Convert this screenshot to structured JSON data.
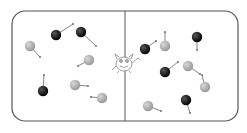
{
  "diagram": {
    "container": {
      "x": 12,
      "y": 11,
      "width": 226,
      "height": 110,
      "radius": 13,
      "stroke": "#555555"
    },
    "divider": {
      "x": 125,
      "y1": 11,
      "y2": 121,
      "stroke": "#555555"
    },
    "colors": {
      "fast": "#111111",
      "slow": "#a8a8a8",
      "arrow": "#666666"
    },
    "particles": [
      {
        "side": "left",
        "type": "fast",
        "x": 56,
        "y": 35,
        "ax": 73,
        "ay": 24
      },
      {
        "side": "left",
        "type": "fast",
        "x": 81,
        "y": 32,
        "ax": 96,
        "ay": 46
      },
      {
        "side": "left",
        "type": "slow",
        "x": 30,
        "y": 46,
        "ax": 40,
        "ay": 57
      },
      {
        "side": "left",
        "type": "slow",
        "x": 89,
        "y": 60,
        "ax": 78,
        "ay": 66
      },
      {
        "side": "left",
        "type": "fast",
        "x": 43,
        "y": 91,
        "ax": 44,
        "ay": 75
      },
      {
        "side": "left",
        "type": "slow",
        "x": 75,
        "y": 85,
        "ax": 88,
        "ay": 86
      },
      {
        "side": "left",
        "type": "slow",
        "x": 102,
        "y": 98,
        "ax": 91,
        "ay": 97
      },
      {
        "side": "right",
        "type": "fast",
        "x": 145,
        "y": 49,
        "ax": 156,
        "ay": 41
      },
      {
        "side": "right",
        "type": "slow",
        "x": 165,
        "y": 46,
        "ax": 165,
        "ay": 32
      },
      {
        "side": "right",
        "type": "fast",
        "x": 197,
        "y": 37,
        "ax": 197,
        "ay": 50
      },
      {
        "side": "right",
        "type": "fast",
        "x": 165,
        "y": 72,
        "ax": 178,
        "ay": 62
      },
      {
        "side": "right",
        "type": "slow",
        "x": 188,
        "y": 66,
        "ax": 200,
        "ay": 74
      },
      {
        "side": "right",
        "type": "slow",
        "x": 205,
        "y": 87,
        "ax": 202,
        "ay": 75
      },
      {
        "side": "right",
        "type": "slow",
        "x": 148,
        "y": 106,
        "ax": 161,
        "ay": 111
      },
      {
        "side": "right",
        "type": "fast",
        "x": 186,
        "y": 100,
        "ax": 190,
        "ay": 113
      }
    ],
    "demon": {
      "x": 124,
      "y": 63,
      "label": "demon"
    }
  }
}
